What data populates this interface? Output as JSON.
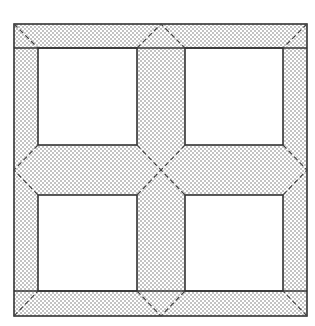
{
  "diagram": {
    "type": "quilt-block",
    "colors": {
      "background": "#ffffff",
      "outline": "#333333",
      "stipple_dot": "#6a6a6a",
      "fold_line": "#444444"
    },
    "frame": {
      "x": 14,
      "y": 24,
      "w": 293,
      "h": 292
    },
    "border_width": 24,
    "sashing": {
      "vertical": {
        "x": 137,
        "w": 48
      },
      "horizontal": {
        "y": 145,
        "h": 50
      }
    },
    "open_squares": 4
  }
}
